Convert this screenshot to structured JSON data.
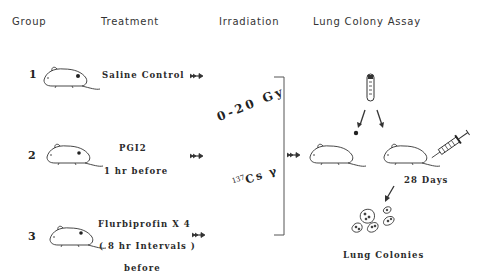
{
  "headers": {
    "group": "Group",
    "treatment": "Treatment",
    "irradiation": "Irradiation",
    "assay": "Lung Colony Assay"
  },
  "groups": [
    {
      "number": "1",
      "treatment_lines": [
        "Saline Control"
      ]
    },
    {
      "number": "2",
      "treatment_lines": [
        "PGI2",
        "1 hr before"
      ]
    },
    {
      "number": "3",
      "treatment_lines": [
        "Flurbiprofin X 4",
        "( 8 hr Intervals )",
        "before"
      ]
    }
  ],
  "irradiation": {
    "dose": "0-20 Gy",
    "source_superscript": "137",
    "source": "Cs γ"
  },
  "assay": {
    "interval_label": "28 Days",
    "result_label": "Lung Colonies"
  },
  "icons": [
    "mouse-icon",
    "arrow-right-icon",
    "test-tube-icon",
    "syringe-icon",
    "lung-colonies-icon",
    "bracket"
  ],
  "colors": {
    "ink": "#2a2a2a",
    "background": "#ffffff"
  }
}
